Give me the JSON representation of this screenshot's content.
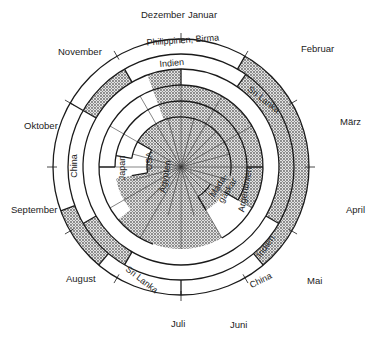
{
  "months": [
    "Januar",
    "Februar",
    "März",
    "April",
    "Mai",
    "Juni",
    "Juli",
    "August",
    "September",
    "Oktober",
    "November",
    "Dezember"
  ],
  "ring_labels": {
    "outer": {
      "philippinen_birma": "Philippinen, Birma",
      "china_left": "China",
      "sri_lanka_lower": "Sri Lanka",
      "china_lower": "China"
    },
    "third": {
      "indien_top": "Indien",
      "sri_lanka_top": "Sri Lanka",
      "indien_right": "Indien"
    },
    "fourth": {
      "japan": "Japan",
      "argentinien": "Argentinien"
    },
    "fifth": {
      "usa": "USA",
      "madagaskar": "Mada-\ngaskar"
    },
    "inner": {
      "aegypten": "Ägypten"
    }
  },
  "colors": {
    "stroke": "#1a1a1a",
    "shade": "#b8b8b8",
    "paper": "#ffffff"
  }
}
